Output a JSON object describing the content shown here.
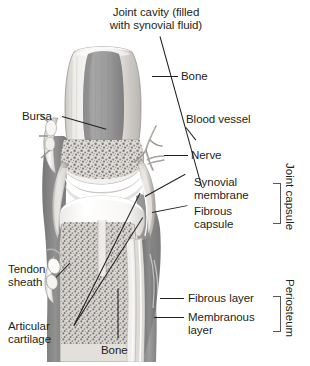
{
  "figure": {
    "background": "#ffffff",
    "ink": "#231f20",
    "bracket_color": "#58585b"
  },
  "labels": {
    "joint_cavity": "Joint cavity (filled\nwith synovial fluid)",
    "bone_top": "Bone",
    "bursa": "Bursa",
    "blood_vessel": "Blood vessel",
    "nerve": "Nerve",
    "synovial_membrane": "Synovial\nmembrane",
    "fibrous_capsule": "Fibrous\ncapsule",
    "joint_capsule": "Joint capsule",
    "tendon_sheath": "Tendon\nsheath",
    "articular_cartilage": "Articular\ncartilage",
    "bone_bottom": "Bone",
    "fibrous_layer": "Fibrous layer",
    "membranous_layer": "Membranous\nlayer",
    "periosteum": "Periosteum"
  },
  "brackets": [
    {
      "name": "joint-capsule-bracket",
      "groups": [
        "Synovial membrane",
        "Fibrous capsule"
      ]
    },
    {
      "name": "periosteum-bracket",
      "groups": [
        "Fibrous layer",
        "Membranous layer"
      ]
    }
  ],
  "illustration": {
    "type": "grayscale-anatomical-drawing",
    "subject": "longitudinal section of a synovial joint",
    "parts": [
      "upper bone (epiphysis and shaft)",
      "medullary cavity",
      "spongy / trabecular bone",
      "articular cartilage",
      "joint cavity",
      "lower bone",
      "joint capsule",
      "synovial membrane",
      "fibrous capsule",
      "bursa",
      "tendon sheath",
      "blood vessel",
      "nerve",
      "periosteum"
    ],
    "palette": {
      "cortical_bone": "#e8e6e2",
      "cartilage": "#fbfbfa",
      "marrow": "#9a9a9a",
      "spongy_bone": "#d9d7d3",
      "soft_tissue": "#8e8e8e",
      "capsule": "#c9c7c3",
      "outline": "#6d6d6d"
    }
  }
}
